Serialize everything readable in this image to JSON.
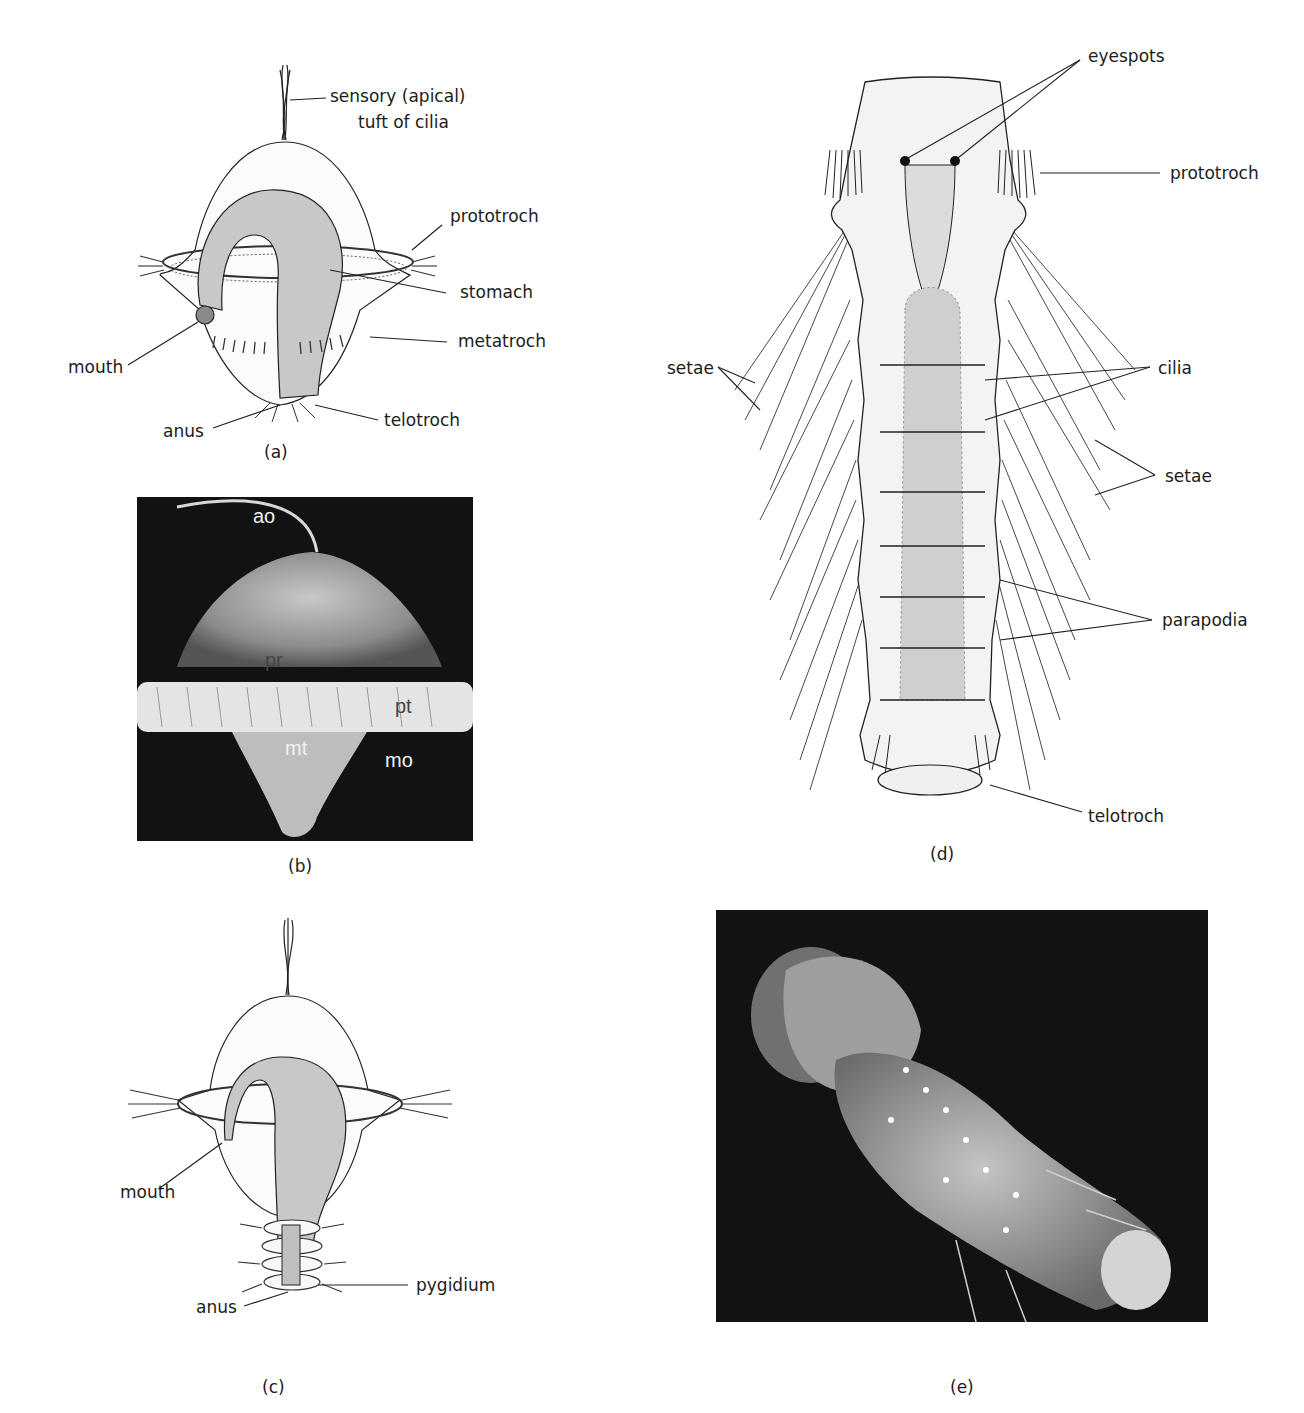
{
  "page": {
    "running_header": "The Annelida   235"
  },
  "figure": {
    "panels": [
      {
        "id": "a",
        "caption": "(a)",
        "type": "line-drawing",
        "labels": {
          "apical_tuft": "sensory (apical)",
          "apical_tuft_line2": "tuft of cilia",
          "prototroch": "prototroch",
          "stomach": "stomach",
          "metatroch": "metatroch",
          "mouth": "mouth",
          "anus": "anus",
          "telotroch": "telotroch"
        }
      },
      {
        "id": "b",
        "caption": "(b)",
        "type": "micrograph",
        "labels": {
          "ao": "ao",
          "pr": "pr",
          "pt": "pt",
          "mt": "mt",
          "mo": "mo"
        }
      },
      {
        "id": "c",
        "caption": "(c)",
        "type": "line-drawing",
        "labels": {
          "mouth": "mouth",
          "pygidium": "pygidium",
          "anus": "anus"
        }
      },
      {
        "id": "d",
        "caption": "(d)",
        "type": "line-drawing",
        "labels": {
          "eyespots": "eyespots",
          "prototroch": "prototroch",
          "setae_left": "setae",
          "cilia": "cilia",
          "setae_right": "setae",
          "parapodia": "parapodia",
          "telotroch": "telotroch"
        }
      },
      {
        "id": "e",
        "caption": "(e)",
        "type": "micrograph",
        "labels": {}
      }
    ]
  }
}
